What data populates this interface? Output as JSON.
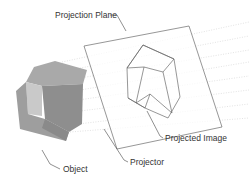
{
  "diagram": {
    "type": "orthographic-projection",
    "labels": {
      "projection_plane": "Projection Plane",
      "object": "Object",
      "projector": "Projector",
      "projected_image": "Projected Image"
    },
    "colors": {
      "background": "#ffffff",
      "line": "#6a6a6a",
      "projector_lines": "#c8c8c8",
      "cube_top": "#a9a9a9",
      "cube_left": "#c4c4c4",
      "cube_front": "#8c8c8c",
      "cube_notch": "#d6d6d6",
      "label_text": "#333333"
    }
  }
}
